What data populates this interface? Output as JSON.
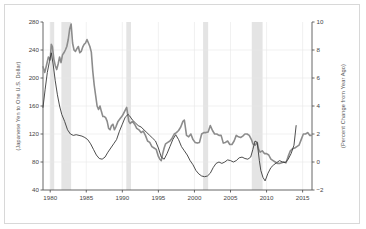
{
  "chart_data": {
    "type": "line",
    "title": "",
    "subtitle": "",
    "xlabel": "",
    "ylabel": "(Japanese Yen to One U.S. Dollar)",
    "y2label": "(Percent Change from Year Ago)",
    "xlim": [
      1979.0,
      2016.3
    ],
    "ylim": [
      40,
      280
    ],
    "y2lim": [
      -2,
      10
    ],
    "yticks": [
      40,
      80,
      120,
      160,
      200,
      240,
      280
    ],
    "y2ticks": [
      -2,
      0,
      2,
      4,
      6,
      8,
      10
    ],
    "xticks": [
      1980,
      1985,
      1990,
      1995,
      2000,
      2005,
      2010,
      2015
    ],
    "grid": "horizontal-light",
    "legend": "none",
    "colors": {
      "exchange_rate_line": "#8c8c8c",
      "percent_change_line": "#3a3a3a",
      "recession_band": "#e4e4e4",
      "frame": "#555555",
      "outer_border": "#d8d8d8",
      "gridline": "#e8e8e8"
    },
    "recession_bands": [
      {
        "start": 1980.0,
        "end": 1980.55
      },
      {
        "start": 1981.55,
        "end": 1982.9
      },
      {
        "start": 1990.55,
        "end": 1991.2
      },
      {
        "start": 2001.2,
        "end": 2001.9
      },
      {
        "start": 2007.95,
        "end": 2009.45
      }
    ],
    "series": [
      {
        "name": "Japanese Yen to One U.S. Dollar",
        "axis": "left",
        "width": 1.6,
        "x": [
          1979.0,
          1979.25,
          1979.5,
          1979.75,
          1980.0,
          1980.15,
          1980.3,
          1980.5,
          1980.7,
          1980.9,
          1981.1,
          1981.3,
          1981.5,
          1981.7,
          1981.9,
          1982.1,
          1982.3,
          1982.5,
          1982.7,
          1982.9,
          1983.1,
          1983.3,
          1983.5,
          1983.7,
          1983.9,
          1984.1,
          1984.3,
          1984.5,
          1984.7,
          1984.9,
          1985.1,
          1985.3,
          1985.5,
          1985.7,
          1985.9,
          1986.1,
          1986.3,
          1986.5,
          1986.7,
          1986.9,
          1987.1,
          1987.3,
          1987.5,
          1987.7,
          1987.9,
          1988.1,
          1988.3,
          1988.5,
          1988.7,
          1988.9,
          1989.1,
          1989.4,
          1989.7,
          1990.0,
          1990.3,
          1990.6,
          1990.9,
          1991.1,
          1991.4,
          1991.7,
          1992.0,
          1992.3,
          1992.6,
          1992.9,
          1993.2,
          1993.5,
          1993.8,
          1994.1,
          1994.4,
          1994.7,
          1995.0,
          1995.2,
          1995.4,
          1995.6,
          1995.8,
          1996.0,
          1996.3,
          1996.6,
          1996.9,
          1997.2,
          1997.5,
          1997.8,
          1998.1,
          1998.4,
          1998.6,
          1998.9,
          1999.2,
          1999.5,
          1999.8,
          2000.1,
          2000.4,
          2000.7,
          2001.0,
          2001.3,
          2001.6,
          2001.9,
          2002.2,
          2002.5,
          2002.8,
          2003.1,
          2003.4,
          2003.7,
          2004.0,
          2004.3,
          2004.6,
          2004.9,
          2005.2,
          2005.5,
          2005.8,
          2006.1,
          2006.4,
          2006.7,
          2007.0,
          2007.3,
          2007.6,
          2007.9,
          2008.1,
          2008.4,
          2008.7,
          2008.9,
          2009.1,
          2009.4,
          2009.7,
          2010.0,
          2010.3,
          2010.6,
          2010.9,
          2011.2,
          2011.5,
          2011.8,
          2012.1,
          2012.4,
          2012.7,
          2013.0,
          2013.3,
          2013.6,
          2013.9,
          2014.2,
          2014.5,
          2014.8,
          2015.1,
          2015.4,
          2015.7,
          2016.0,
          2016.2
        ],
        "y": [
          216,
          208,
          219,
          230,
          226,
          248,
          245,
          227,
          218,
          212,
          220,
          230,
          222,
          233,
          236,
          240,
          245,
          255,
          270,
          277,
          250,
          240,
          238,
          242,
          245,
          236,
          238,
          244,
          248,
          250,
          255,
          250,
          245,
          237,
          210,
          190,
          175,
          160,
          155,
          160,
          152,
          145,
          145,
          143,
          138,
          128,
          126,
          132,
          134,
          126,
          130,
          138,
          142,
          146,
          152,
          158,
          138,
          135,
          138,
          134,
          128,
          126,
          122,
          124,
          118,
          110,
          108,
          102,
          100,
          98,
          88,
          84,
          82,
          92,
          100,
          106,
          108,
          110,
          114,
          120,
          122,
          125,
          130,
          138,
          140,
          118,
          116,
          120,
          112,
          108,
          107,
          108,
          120,
          122,
          122,
          123,
          132,
          125,
          120,
          120,
          118,
          118,
          107,
          108,
          110,
          105,
          105,
          110,
          118,
          116,
          115,
          117,
          120,
          120,
          118,
          112,
          106,
          104,
          108,
          98,
          94,
          96,
          92,
          92,
          90,
          84,
          82,
          80,
          78,
          78,
          79,
          80,
          79,
          88,
          96,
          99,
          100,
          102,
          104,
          112,
          120,
          120,
          122,
          118,
          118
        ]
      },
      {
        "name": "Percent Change from Year Ago",
        "axis": "right",
        "width": 0.9,
        "x": [
          1979.0,
          1979.3,
          1979.6,
          1979.9,
          1980.15,
          1980.4,
          1980.7,
          1981.0,
          1981.3,
          1981.6,
          1982.0,
          1982.4,
          1982.8,
          1983.2,
          1983.6,
          1984.0,
          1984.4,
          1984.8,
          1985.2,
          1985.6,
          1986.0,
          1986.4,
          1986.8,
          1987.2,
          1987.6,
          1988.0,
          1988.4,
          1988.8,
          1989.2,
          1989.6,
          1990.0,
          1990.4,
          1990.8,
          1991.0,
          1991.4,
          1991.8,
          1992.2,
          1992.6,
          1993.0,
          1993.4,
          1993.8,
          1994.2,
          1994.6,
          1995.0,
          1995.4,
          1995.8,
          1996.2,
          1996.6,
          1997.0,
          1997.4,
          1997.8,
          1998.2,
          1998.6,
          1999.0,
          1999.4,
          1999.8,
          2000.2,
          2000.6,
          2001.0,
          2001.4,
          2001.8,
          2002.2,
          2002.6,
          2003.0,
          2003.4,
          2003.8,
          2004.2,
          2004.6,
          2005.0,
          2005.4,
          2005.8,
          2006.2,
          2006.6,
          2007.0,
          2007.4,
          2007.8,
          2008.1,
          2008.4,
          2008.7,
          2009.0,
          2009.2,
          2009.5,
          2009.8,
          2010.2,
          2010.6,
          2011.0,
          2011.4,
          2011.8,
          2012.2,
          2012.6,
          2013.0,
          2013.4,
          2013.8,
          2014.1
        ],
        "y": [
          3.9,
          5.2,
          6.4,
          7.2,
          7.8,
          7.0,
          5.8,
          4.8,
          4.0,
          3.4,
          2.9,
          2.3,
          2.0,
          1.9,
          1.95,
          1.9,
          1.85,
          1.75,
          1.6,
          1.3,
          0.9,
          0.5,
          0.25,
          0.2,
          0.35,
          0.7,
          1.0,
          1.3,
          1.6,
          2.2,
          2.7,
          3.2,
          3.4,
          3.3,
          3.0,
          2.8,
          2.6,
          2.5,
          2.3,
          2.1,
          1.9,
          1.7,
          1.5,
          1.0,
          0.35,
          0.2,
          0.6,
          1.1,
          1.6,
          1.95,
          1.6,
          1.1,
          0.8,
          0.5,
          0.1,
          -0.2,
          -0.6,
          -0.85,
          -1.0,
          -1.05,
          -1.0,
          -0.8,
          -0.4,
          -0.1,
          0.0,
          -0.1,
          0.0,
          0.15,
          0.1,
          0.0,
          0.1,
          0.3,
          0.35,
          0.25,
          0.2,
          0.35,
          0.9,
          1.5,
          1.4,
          0.1,
          -0.6,
          -1.1,
          -1.35,
          -0.8,
          -0.4,
          -0.2,
          -0.05,
          0.1,
          0.0,
          -0.05,
          0.2,
          0.6,
          1.2,
          2.6
        ]
      }
    ]
  }
}
